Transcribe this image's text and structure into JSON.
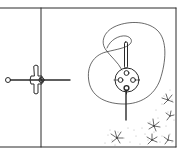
{
  "figure": {
    "colors": {
      "ink": "#2a2a2a",
      "background": "#ffffff",
      "stipple": "#6a6a6a"
    },
    "frame": {
      "top": 8,
      "bottom": 147,
      "left": 0,
      "right": 176,
      "divider_x": 41
    },
    "left_panel": {
      "rod": {
        "x1": 9,
        "x2": 70,
        "y": 80
      },
      "end_ring": {
        "cx": 8,
        "cy": 80,
        "r": 2.5
      },
      "handle": {
        "x": 36,
        "y_top": 65,
        "y_bottom": 94,
        "width": 5
      },
      "knob": {
        "cx": 41,
        "cy": 80,
        "r": 3
      }
    },
    "right_panel": {
      "spindle": {
        "x": 126,
        "y_top": 42,
        "y_bottom": 120
      },
      "disc": {
        "cx": 127,
        "cy": 80,
        "r": 12
      },
      "disc_holes": [
        {
          "cx": 120,
          "cy": 80,
          "r": 2.5
        },
        {
          "cx": 133,
          "cy": 80,
          "r": 2.5
        },
        {
          "cx": 126,
          "cy": 73,
          "r": 2.5
        },
        {
          "cx": 126,
          "cy": 88,
          "r": 2.5
        }
      ],
      "flower_count": 6
    }
  }
}
